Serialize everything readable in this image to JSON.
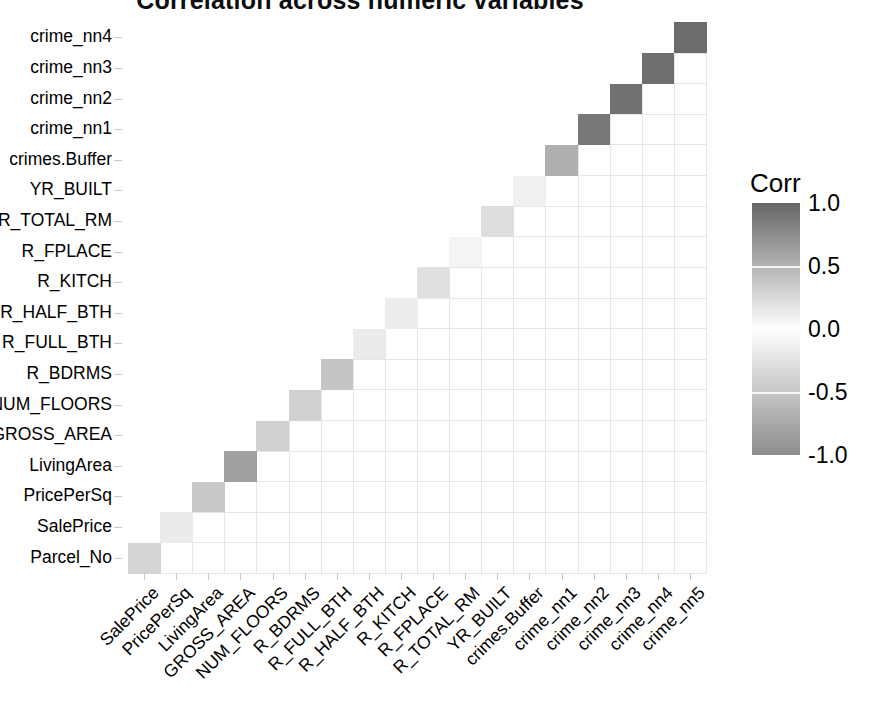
{
  "chart_data": {
    "type": "heatmap",
    "title": "Correlation across numeric variables",
    "xlabel": "",
    "ylabel": "",
    "grid": true,
    "legend_position": "right",
    "legend": {
      "title": "Corr",
      "ticks": [
        "1.0",
        "0.5",
        "0.0",
        "-0.5",
        "-1.0"
      ],
      "tick_values": [
        1.0,
        0.5,
        0.0,
        -0.5,
        -1.0
      ],
      "zlim": [
        -1.0,
        1.0
      ],
      "low_color": "#999999",
      "mid_color": "#ffffff",
      "high_color": "#666666"
    },
    "x_categories": [
      "SalePrice",
      "PricePerSq",
      "LivingArea",
      "GROSS_AREA",
      "NUM_FLOORS",
      "R_BDRMS",
      "R_FULL_BTH",
      "R_HALF_BTH",
      "R_KITCH",
      "R_FPLACE",
      "R_TOTAL_RM",
      "YR_BUILT",
      "crimes.Buffer",
      "crime_nn1",
      "crime_nn2",
      "crime_nn3",
      "crime_nn4",
      "crime_nn5"
    ],
    "y_categories": [
      "Parcel_No",
      "SalePrice",
      "PricePerSq",
      "LivingArea",
      "GROSS_AREA",
      "NUM_FLOORS",
      "R_BDRMS",
      "R_FULL_BTH",
      "R_HALF_BTH",
      "R_KITCH",
      "R_FPLACE",
      "R_TOTAL_RM",
      "YR_BUILT",
      "crimes.Buffer",
      "crime_nn1",
      "crime_nn2",
      "crime_nn3",
      "crime_nn4"
    ],
    "y_tick_labels_top_to_bottom": [
      "crime_nn4",
      "crime_nn3",
      "crime_nn2",
      "crime_nn1",
      "crimes.Buffer",
      "YR_BUILT",
      "R_TOTAL_RM",
      "R_FPLACE",
      "R_KITCH",
      "R_HALF_BTH",
      "R_FULL_BTH",
      "R_BDRMS",
      "NUM_FLOORS",
      "GROSS_AREA",
      "LivingArea",
      "PricePerSq",
      "SalePrice",
      "Parcel_No"
    ],
    "x_tick_labels_left_to_right": [
      "SalePrice",
      "PricePerSq",
      "LivingArea",
      "GROSS_AREA",
      "NUM_FLOORS",
      "R_BDRMS",
      "R_FULL_BTH",
      "R_HALF_BTH",
      "R_KITCH",
      "R_FPLACE",
      "R_TOTAL_RM",
      "YR_BUILT",
      "crimes.Buffer",
      "crime_nn1",
      "crime_nn2",
      "crime_nn3",
      "crime_nn4",
      "crime_nn5"
    ],
    "shape": "lower-triangle",
    "note": "Row i (y_categories) plotted against column j (x_categories); only cells with column index <= row index are drawn.",
    "values": [
      [
        0.28,
        0.12,
        0.1,
        -0.02,
        0.3,
        0.08,
        0.06,
        -0.04,
        0.26,
        0.03,
        0.05,
        0.11,
        0.08,
        0.42,
        0.44,
        0.45,
        0.44,
        0.43
      ],
      [
        0.0,
        0.13,
        0.35,
        0.12,
        0.42,
        0.14,
        0.3,
        0.0,
        0.32,
        0.13,
        0.07,
        0.02,
        0.02,
        0.02,
        0.02,
        0.02,
        0.02,
        0.01
      ],
      [
        0.0,
        0.0,
        0.35,
        0.33,
        0.1,
        0.3,
        0.28,
        0.08,
        0.33,
        0.27,
        0.02,
        0.27,
        0.27,
        0.27,
        0.27,
        0.27,
        0.27,
        0.26
      ],
      [
        0.0,
        0.0,
        0.0,
        0.62,
        0.3,
        0.55,
        0.56,
        0.16,
        0.55,
        0.33,
        0.06,
        0.32,
        0.3,
        0.3,
        0.29,
        0.28,
        0.27,
        0.27
      ],
      [
        0.0,
        0.0,
        0.0,
        0.0,
        0.31,
        0.44,
        0.42,
        0.15,
        0.5,
        0.28,
        0.05,
        0.31,
        0.26,
        0.26,
        0.25,
        0.24,
        0.23,
        0.22
      ],
      [
        0.0,
        0.0,
        0.0,
        0.0,
        0.0,
        0.3,
        0.31,
        0.17,
        0.3,
        0.2,
        0.03,
        0.15,
        0.2,
        0.2,
        0.2,
        0.19,
        0.18,
        0.18
      ],
      [
        0.0,
        0.0,
        0.0,
        0.0,
        0.0,
        0.0,
        0.38,
        0.1,
        0.56,
        0.3,
        0.04,
        0.25,
        0.25,
        0.25,
        0.25,
        0.24,
        0.23,
        0.23
      ],
      [
        0.0,
        0.0,
        0.0,
        0.0,
        0.0,
        0.0,
        0.0,
        0.13,
        0.46,
        0.29,
        0.05,
        0.23,
        0.24,
        0.24,
        0.23,
        0.22,
        0.22,
        0.21
      ],
      [
        0.0,
        0.0,
        0.0,
        0.0,
        0.0,
        0.0,
        0.0,
        0.0,
        0.12,
        0.16,
        0.05,
        0.1,
        0.13,
        0.13,
        0.12,
        0.12,
        0.11,
        0.11
      ],
      [
        0.0,
        0.0,
        0.0,
        0.0,
        0.0,
        0.0,
        0.0,
        0.0,
        0.0,
        0.2,
        0.06,
        0.33,
        0.25,
        0.25,
        0.24,
        0.23,
        0.22,
        0.22
      ],
      [
        0.0,
        0.0,
        0.0,
        0.0,
        0.0,
        0.0,
        0.0,
        0.0,
        0.0,
        0.0,
        0.07,
        0.14,
        0.17,
        0.17,
        0.17,
        0.16,
        0.16,
        0.16
      ],
      [
        0.0,
        0.0,
        0.0,
        0.0,
        0.0,
        0.0,
        0.0,
        0.0,
        0.0,
        0.0,
        0.0,
        0.22,
        0.28,
        0.28,
        0.27,
        0.26,
        0.25,
        0.25
      ],
      [
        0.0,
        0.0,
        0.0,
        0.0,
        0.0,
        0.0,
        0.0,
        0.0,
        0.0,
        0.0,
        0.0,
        0.0,
        0.1,
        0.1,
        0.09,
        0.08,
        0.07,
        0.07
      ],
      [
        0.0,
        0.0,
        0.0,
        0.0,
        0.0,
        0.0,
        0.0,
        0.0,
        0.0,
        0.0,
        0.0,
        0.0,
        0.0,
        0.52,
        0.52,
        0.52,
        0.51,
        0.51
      ],
      [
        0.0,
        0.0,
        0.0,
        0.0,
        0.0,
        0.0,
        0.0,
        0.0,
        0.0,
        0.0,
        0.0,
        0.0,
        0.0,
        0.0,
        0.88,
        0.86,
        0.85,
        0.84
      ],
      [
        0.0,
        0.0,
        0.0,
        0.0,
        0.0,
        0.0,
        0.0,
        0.0,
        0.0,
        0.0,
        0.0,
        0.0,
        0.0,
        0.0,
        0.0,
        0.93,
        0.9,
        0.88
      ],
      [
        0.0,
        0.0,
        0.0,
        0.0,
        0.0,
        0.0,
        0.0,
        0.0,
        0.0,
        0.0,
        0.0,
        0.0,
        0.0,
        0.0,
        0.0,
        0.0,
        0.95,
        0.92
      ],
      [
        0.0,
        0.0,
        0.0,
        0.0,
        0.0,
        0.0,
        0.0,
        0.0,
        0.0,
        0.0,
        0.0,
        0.0,
        0.0,
        0.0,
        0.0,
        0.0,
        0.0,
        0.96
      ]
    ]
  }
}
